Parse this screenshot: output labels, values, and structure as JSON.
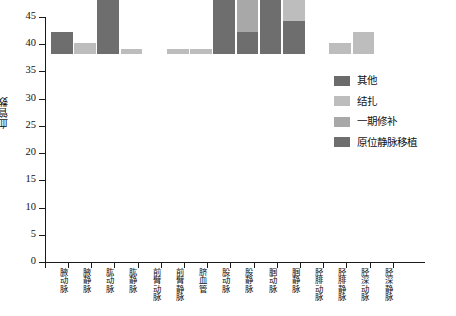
{
  "chart_data": {
    "type": "bar",
    "subtype": "stacked-vertical",
    "title": "",
    "xlabel": "",
    "ylabel": "血管数",
    "ylim": [
      0,
      45
    ],
    "yticks": [
      0,
      5,
      10,
      15,
      20,
      25,
      30,
      35,
      40,
      45
    ],
    "grid": false,
    "legend_position": "right",
    "categories": [
      "腋动脉",
      "腋静脉",
      "肱动脉",
      "肱静脉",
      "前臂动脉",
      "前臂静脉",
      "脐血管",
      "股动脉",
      "股静脉",
      "腘动脉",
      "腘静脉",
      "胫腓动脉",
      "胫腓静脉",
      "胫深动脉",
      "胫深静脉"
    ],
    "series": [
      {
        "name": "原位静脉移植",
        "color": "#6e6e6e",
        "values": [
          4,
          0,
          26,
          0,
          0,
          0,
          0,
          29,
          4,
          18,
          6,
          0,
          0,
          0,
          0
        ]
      },
      {
        "name": "一期修补",
        "color": "#a8a8a8",
        "values": [
          0,
          0,
          0,
          0,
          0,
          0,
          0,
          2,
          11,
          6,
          0,
          0,
          0,
          0,
          0
        ]
      },
      {
        "name": "结扎",
        "color": "#bdbdbd",
        "values": [
          0,
          2,
          1,
          1,
          0,
          1,
          1,
          4,
          18,
          13,
          24,
          0,
          2,
          4,
          0
        ]
      },
      {
        "name": "其他",
        "color": "#6b6b6b",
        "values": [
          0,
          0,
          0,
          0,
          0,
          0,
          0,
          2,
          0,
          2,
          0,
          0,
          0,
          0,
          0
        ]
      }
    ],
    "totals": [
      4,
      2,
      27,
      1,
      0,
      1,
      1,
      37,
      33,
      39,
      30,
      0,
      2,
      4,
      0
    ]
  },
  "legend": {
    "items": [
      {
        "label": "其他",
        "color": "#6b6b6b"
      },
      {
        "label": "结扎",
        "color": "#bdbdbd"
      },
      {
        "label": "一期修补",
        "color": "#a8a8a8"
      },
      {
        "label": "原位静脉移植",
        "color": "#6e6e6e"
      }
    ]
  },
  "axis": {
    "y_title": "血管数",
    "y_labels": [
      "45",
      "40",
      "35",
      "30",
      "25",
      "20",
      "15",
      "10",
      "5",
      "0"
    ]
  }
}
